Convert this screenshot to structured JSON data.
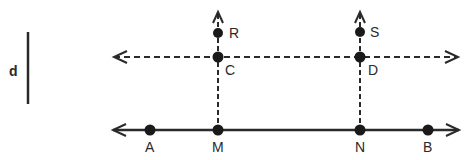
{
  "diagram": {
    "segment_label": "d",
    "points": {
      "R": "R",
      "S": "S",
      "C": "C",
      "D": "D",
      "A": "A",
      "M": "M",
      "N": "N",
      "B": "B"
    },
    "colors": {
      "stroke": "#2a2a2a",
      "background": "#ffffff"
    }
  }
}
